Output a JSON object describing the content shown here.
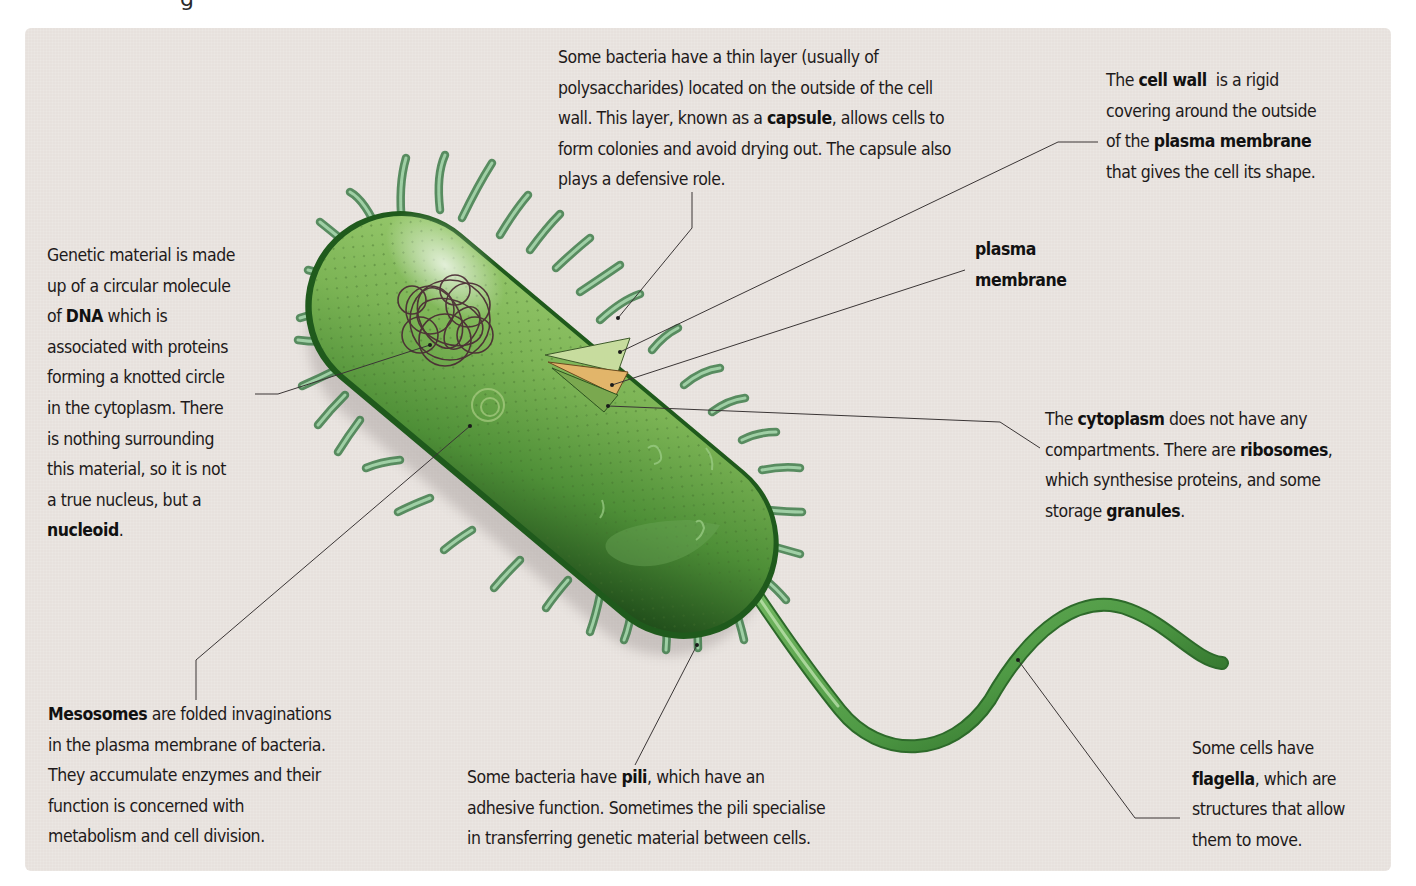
{
  "page": {
    "top_heading_fragment": "g"
  },
  "diagram": {
    "colors": {
      "panel_background": "#e7e1dd",
      "cell_body_light": "#8cc063",
      "cell_body_dark": "#1f5a1c",
      "pili": "#6fae78",
      "nucleoid": "#4a2a34",
      "leader_line": "#3a3535",
      "text": "#1e1a1a"
    },
    "labels": {
      "capsule": {
        "lines": [
          {
            "pre": "Some bacteria have a thin layer (usually of",
            "bold": "",
            "post": ""
          },
          {
            "pre": "polysaccharides) located on the outside of the cell",
            "bold": "",
            "post": ""
          },
          {
            "pre": "wall. This layer, known as a ",
            "bold": "capsule",
            "post": ", allows cells to"
          },
          {
            "pre": "form colonies and avoid drying out. The capsule also",
            "bold": "",
            "post": ""
          },
          {
            "pre": "plays a defensive role.",
            "bold": "",
            "post": ""
          }
        ]
      },
      "cell_wall": {
        "lines": [
          {
            "pre": "The ",
            "bold": "cell wall",
            "post": "  is a rigid"
          },
          {
            "pre": "covering around the outside",
            "bold": "",
            "post": ""
          },
          {
            "pre": "of the ",
            "bold": "plasma membrane",
            "post": ""
          },
          {
            "pre": "that gives the cell its shape.",
            "bold": "",
            "post": ""
          }
        ]
      },
      "plasma_membrane": {
        "lines": [
          {
            "pre": "",
            "bold": "plasma",
            "post": ""
          },
          {
            "pre": "",
            "bold": "membrane",
            "post": ""
          }
        ]
      },
      "nucleoid": {
        "lines": [
          {
            "pre": "Genetic material is made",
            "bold": "",
            "post": ""
          },
          {
            "pre": "up of a circular molecule",
            "bold": "",
            "post": ""
          },
          {
            "pre": "of ",
            "bold": "DNA",
            "post": " which is"
          },
          {
            "pre": "associated with proteins",
            "bold": "",
            "post": ""
          },
          {
            "pre": "forming a knotted circle",
            "bold": "",
            "post": ""
          },
          {
            "pre": "in the cytoplasm. There",
            "bold": "",
            "post": ""
          },
          {
            "pre": "is nothing surrounding",
            "bold": "",
            "post": ""
          },
          {
            "pre": "this material, so it is not",
            "bold": "",
            "post": ""
          },
          {
            "pre": "a true nucleus, but a",
            "bold": "",
            "post": ""
          },
          {
            "pre": "",
            "bold": "nucleoid",
            "post": "."
          }
        ]
      },
      "cytoplasm": {
        "lines": [
          {
            "pre": "The ",
            "bold": "cytoplasm",
            "post": " does not have any"
          },
          {
            "pre": "compartments. There are ",
            "bold": "ribosomes",
            "post": ","
          },
          {
            "pre": "which synthesise proteins, and some",
            "bold": "",
            "post": ""
          },
          {
            "pre": "storage ",
            "bold": "granules",
            "post": "."
          }
        ]
      },
      "mesosomes": {
        "lines": [
          {
            "pre": "",
            "bold": "Mesosomes",
            "post": " are folded invaginations"
          },
          {
            "pre": "in the plasma membrane of bacteria.",
            "bold": "",
            "post": ""
          },
          {
            "pre": "They accumulate enzymes and their",
            "bold": "",
            "post": ""
          },
          {
            "pre": "function is concerned with",
            "bold": "",
            "post": ""
          },
          {
            "pre": "metabolism and cell division.",
            "bold": "",
            "post": ""
          }
        ]
      },
      "pili": {
        "lines": [
          {
            "pre": "Some bacteria have ",
            "bold": "pili",
            "post": ", which have an"
          },
          {
            "pre": "adhesive function. Sometimes the pili specialise",
            "bold": "",
            "post": ""
          },
          {
            "pre": "in transferring genetic material between cells.",
            "bold": "",
            "post": ""
          }
        ]
      },
      "flagella": {
        "lines": [
          {
            "pre": "Some cells have",
            "bold": "",
            "post": ""
          },
          {
            "pre": "",
            "bold": "flagella",
            "post": ", which are"
          },
          {
            "pre": "structures that allow",
            "bold": "",
            "post": ""
          },
          {
            "pre": "them to move.",
            "bold": "",
            "post": ""
          }
        ]
      }
    }
  }
}
